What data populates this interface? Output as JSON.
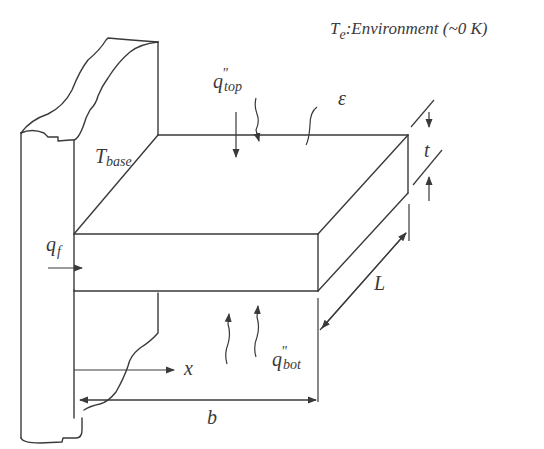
{
  "diagram": {
    "environment_label": {
      "symbol": "T",
      "subscript": "e",
      "text": ":Environment (~0 K)"
    },
    "labels": {
      "T_base": {
        "symbol": "T",
        "subscript": "base"
      },
      "q_top": {
        "symbol": "q",
        "superscript": "\"",
        "subscript": "top"
      },
      "q_bot": {
        "symbol": "q",
        "superscript": "\"",
        "subscript": "bot"
      },
      "q_f": {
        "symbol": "q",
        "subscript": "f"
      },
      "emissivity": "ε",
      "thickness": "t",
      "length": "L",
      "width": "b",
      "axis_x": "x"
    },
    "components": [
      "base-wall",
      "fin-plate",
      "top-heat-flux-arrows",
      "bottom-heat-flux-arrows",
      "fin-heat-flow-arrow",
      "thickness-dimension",
      "length-dimension",
      "width-dimension",
      "x-axis-arrow"
    ],
    "colors": {
      "line": "#3a3a3a",
      "background": "#ffffff"
    }
  }
}
